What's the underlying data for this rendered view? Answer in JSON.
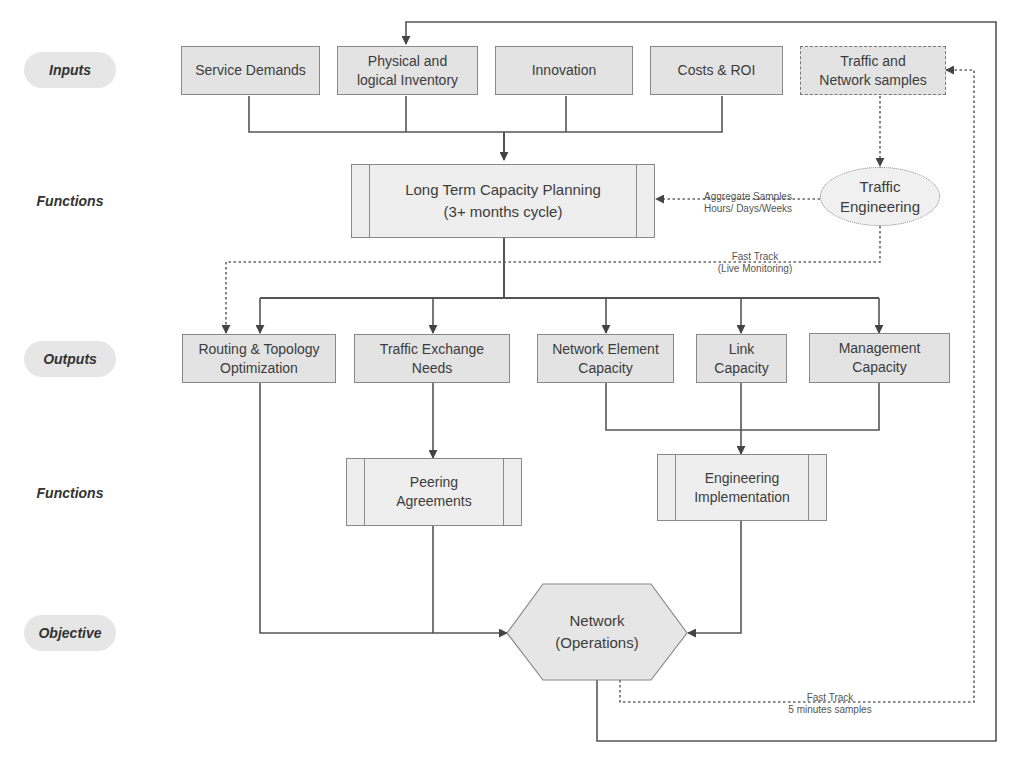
{
  "colors": {
    "box_fill": "#e3e3e3",
    "process_fill": "#eeeeee",
    "border": "#888888",
    "line": "#555555",
    "lane_pill": "#e6e6e6",
    "text": "#3c3c3c"
  },
  "lanes": [
    {
      "label": "Inputs",
      "pill": true
    },
    {
      "label": "Functions",
      "pill": false
    },
    {
      "label": "Outputs",
      "pill": true
    },
    {
      "label": "Functions",
      "pill": false
    },
    {
      "label": "Objective",
      "pill": true
    }
  ],
  "inputs": {
    "service_demands": "Service Demands",
    "inventory": "Physical and\nlogical Inventory",
    "innovation": "Innovation",
    "costs_roi": "Costs & ROI",
    "traffic_samples": "Traffic and\nNetwork samples"
  },
  "functions": {
    "long_term_planning": "Long Term Capacity Planning\n(3+ months cycle)",
    "traffic_engineering": "Traffic\nEngineering",
    "peering_agreements": "Peering\nAgreements",
    "engineering_implementation": "Engineering\nImplementation"
  },
  "outputs": {
    "routing_topology": "Routing & Topology\nOptimization",
    "traffic_exchange": "Traffic Exchange\nNeeds",
    "network_element": "Network Element\nCapacity",
    "link_capacity": "Link\nCapacity",
    "management_capacity": "Management\nCapacity"
  },
  "objective": {
    "network_operations": "Network\n(Operations)"
  },
  "annotations": {
    "aggregate_samples": "Aggregate Samples\nHours/ Days/Weeks",
    "fast_track_live": "Fast Track\n(Live Monitoring)",
    "fast_track_5min": "Fast Track\n5 minutes samples"
  }
}
